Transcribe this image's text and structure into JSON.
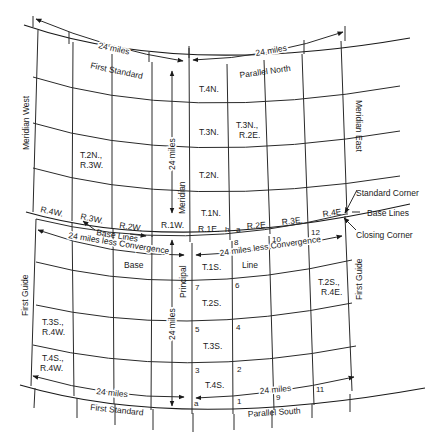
{
  "title_labels": {
    "first_standard_top": "First Standard",
    "parallel_north": "Parallel North",
    "first_standard_bottom": "First Standard",
    "parallel_south": "Parallel South",
    "meridian_west": "Meridian West",
    "meridian_east": "Meridian East",
    "first_guide_left": "First Guide",
    "first_guide_right": "First Guide",
    "principal": "Principal",
    "meridian": "Meridian",
    "base": "Base",
    "line": "Line"
  },
  "dimensions": {
    "top_left": "24 miles",
    "top_right": "24 miles",
    "vertical_upper": "24 miles",
    "vertical_lower": "24 miles",
    "convergence_left": "24 miles less Convergence",
    "convergence_right": "24 miles less Convergence",
    "bottom_left": "24 miles",
    "bottom_right": "24 miles"
  },
  "callouts": {
    "standard_corner": "Standard Corner",
    "base_lines_right": "Base Lines",
    "closing_corner": "Closing Corner",
    "base_lines_left": "Base Lines"
  },
  "townships": {
    "t4n": "T.4N.",
    "t3n": "T.3N.",
    "t3n_r2e_1": "T.3N.,",
    "t3n_r2e_2": "R.2E.",
    "t2n_r3w_1": "T.2N.,",
    "t2n_r3w_2": "R.3W.",
    "t2n": "T.2N.",
    "t1n": "T.1N.",
    "t1s": "T.1S.",
    "t2s": "T.2S.",
    "t3s": "T.3S.",
    "t4s": "T.4S.",
    "t2s_r4e_1": "T.2S.,",
    "t2s_r4e_2": "R.4E.",
    "t3s_r4w_1": "T.3S.,",
    "t3s_r4w_2": "R.4W.",
    "t4s_r4w_1": "T.4S.,",
    "t4s_r4w_2": "R.4W."
  },
  "ranges": {
    "r4w": "R.4W.",
    "r3w": "R.3W.",
    "r2w": "R.2W.",
    "r1w": "R.1W.",
    "r1e": "R.1E.",
    "r2e": "R.2E.",
    "r3e": "R.3E.",
    "r4e": "R.4E"
  },
  "markers": {
    "h": "h",
    "a_top": "a",
    "a_bottom": "a",
    "n1": "1",
    "n2": "2",
    "n3": "3",
    "n4": "4",
    "n5": "5",
    "n6": "6",
    "n7": "7",
    "n8": "8",
    "n9": "9",
    "n10": "10",
    "n11": "11",
    "n12": "12"
  }
}
